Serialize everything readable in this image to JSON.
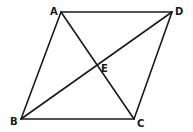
{
  "diagram": {
    "type": "parallelogram-with-diagonals",
    "points": {
      "A": {
        "x": 61,
        "y": 12
      },
      "D": {
        "x": 172,
        "y": 12
      },
      "B": {
        "x": 21,
        "y": 119
      },
      "C": {
        "x": 134,
        "y": 119
      },
      "E": {
        "x": 97,
        "y": 66
      }
    },
    "labels": {
      "A": {
        "text": "A",
        "x": 50,
        "y": 15
      },
      "D": {
        "text": "D",
        "x": 175,
        "y": 15
      },
      "B": {
        "text": "B",
        "x": 10,
        "y": 125
      },
      "C": {
        "text": "C",
        "x": 137,
        "y": 127
      },
      "E": {
        "text": "E",
        "x": 101,
        "y": 72
      }
    },
    "segments": [
      [
        "A",
        "D"
      ],
      [
        "D",
        "C"
      ],
      [
        "C",
        "B"
      ],
      [
        "B",
        "A"
      ],
      [
        "A",
        "C"
      ],
      [
        "B",
        "D"
      ]
    ],
    "stroke_color": "#1a1a1a"
  }
}
